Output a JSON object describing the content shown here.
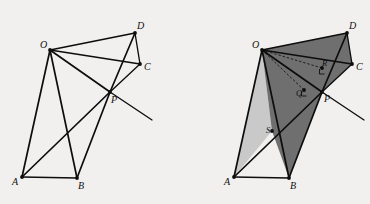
{
  "figure": {
    "background_color": "#f2f0ee",
    "stroke_color": "#0d0d0d",
    "fill_light": "#c9c9c9",
    "fill_dark": "#6f6f6f"
  },
  "panels": [
    {
      "id": "left",
      "name": "unshaded-construction",
      "points": {
        "O": {
          "x": 50,
          "y": 50,
          "label": "O",
          "label_dx": -10,
          "label_dy": -2
        },
        "A": {
          "x": 22,
          "y": 177,
          "label": "A",
          "label_dx": -10,
          "label_dy": 8
        },
        "B": {
          "x": 77,
          "y": 178,
          "label": "B",
          "label_dx": 1,
          "label_dy": 11
        },
        "C": {
          "x": 140,
          "y": 64,
          "label": "C",
          "label_dx": 4,
          "label_dy": 6
        },
        "D": {
          "x": 135,
          "y": 33,
          "label": "D",
          "label_dx": 2,
          "label_dy": -4
        },
        "P": {
          "x": 110,
          "y": 92,
          "label": "P",
          "label_dx": 1,
          "label_dy": 11
        },
        "T": {
          "x": 152,
          "y": 120,
          "label": "",
          "label_dx": 0,
          "label_dy": 0
        }
      },
      "edges": [
        {
          "from": "O",
          "to": "D",
          "name": "segment-od"
        },
        {
          "from": "O",
          "to": "C",
          "name": "segment-oc"
        },
        {
          "from": "O",
          "to": "P",
          "name": "segment-op"
        },
        {
          "from": "O",
          "to": "A",
          "name": "segment-oa"
        },
        {
          "from": "O",
          "to": "B",
          "name": "segment-ob"
        },
        {
          "from": "D",
          "to": "C",
          "name": "segment-dc"
        },
        {
          "from": "D",
          "to": "P",
          "name": "segment-dp"
        },
        {
          "from": "C",
          "to": "P",
          "name": "segment-cp"
        },
        {
          "from": "A",
          "to": "B",
          "name": "segment-ab"
        },
        {
          "from": "A",
          "to": "P",
          "name": "segment-ap"
        },
        {
          "from": "B",
          "to": "P",
          "name": "segment-bp"
        },
        {
          "from": "P",
          "to": "T",
          "name": "ray-pt"
        }
      ]
    },
    {
      "id": "right",
      "name": "shaded-construction",
      "points": {
        "O": {
          "x": 77,
          "y": 50,
          "label": "O",
          "label_dx": -10,
          "label_dy": -2
        },
        "A": {
          "x": 49,
          "y": 177,
          "label": "A",
          "label_dx": -10,
          "label_dy": 8
        },
        "B": {
          "x": 104,
          "y": 178,
          "label": "B",
          "label_dx": 1,
          "label_dy": 11
        },
        "C": {
          "x": 167,
          "y": 64,
          "label": "C",
          "label_dx": 4,
          "label_dy": 6
        },
        "D": {
          "x": 162,
          "y": 33,
          "label": "D",
          "label_dx": 2,
          "label_dy": -4
        },
        "P": {
          "x": 137,
          "y": 92,
          "label": "P",
          "label_dx": 2,
          "label_dy": 10
        },
        "Q": {
          "x": 119,
          "y": 90,
          "label": "Q",
          "label_dx": -8,
          "label_dy": 6
        },
        "R": {
          "x": 137,
          "y": 68,
          "label": "R",
          "label_dx": 0,
          "label_dy": -2
        },
        "S": {
          "x": 87,
          "y": 131,
          "label": "S",
          "label_dx": -6,
          "label_dy": 2
        },
        "T": {
          "x": 179,
          "y": 120,
          "label": "",
          "label_dx": 0,
          "label_dy": 0
        }
      },
      "regions": [
        {
          "name": "region-oas-light",
          "vertices": [
            "O",
            "A",
            "S"
          ],
          "fill": "#c9c9c9"
        },
        {
          "name": "region-osbp-dark",
          "vertices": [
            "O",
            "S",
            "B",
            "P"
          ],
          "fill": "#6f6f6f"
        },
        {
          "name": "region-odcp-dark",
          "vertices": [
            "O",
            "D",
            "C",
            "P"
          ],
          "fill": "#6f6f6f"
        }
      ],
      "edges": [
        {
          "from": "O",
          "to": "D",
          "name": "segment-od"
        },
        {
          "from": "O",
          "to": "C",
          "name": "segment-oc"
        },
        {
          "from": "O",
          "to": "P",
          "name": "segment-op"
        },
        {
          "from": "O",
          "to": "A",
          "name": "segment-oa"
        },
        {
          "from": "O",
          "to": "B",
          "name": "segment-ob"
        },
        {
          "from": "D",
          "to": "C",
          "name": "segment-dc"
        },
        {
          "from": "D",
          "to": "P",
          "name": "segment-dp"
        },
        {
          "from": "C",
          "to": "P",
          "name": "segment-cp"
        },
        {
          "from": "A",
          "to": "B",
          "name": "segment-ab"
        },
        {
          "from": "A",
          "to": "P",
          "name": "segment-ap"
        },
        {
          "from": "B",
          "to": "P",
          "name": "segment-bp"
        },
        {
          "from": "P",
          "to": "T",
          "name": "ray-pt"
        }
      ],
      "dashed_edges": [
        {
          "from": "O",
          "to": "R",
          "name": "perpendicular-or"
        },
        {
          "from": "O",
          "to": "Q",
          "name": "perpendicular-oq"
        }
      ],
      "right_angles": [
        {
          "at": "R",
          "name": "right-angle-mark-r"
        },
        {
          "at": "Q",
          "name": "right-angle-mark-q"
        }
      ]
    }
  ]
}
